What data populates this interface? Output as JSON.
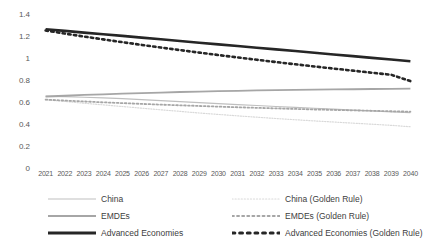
{
  "chart_data": {
    "type": "line",
    "title": "",
    "xlabel": "",
    "ylabel": "",
    "ylim": [
      0,
      1.4
    ],
    "ytick_values": [
      0,
      0.2,
      0.4,
      0.6,
      0.8,
      1,
      1.2,
      1.4
    ],
    "ytick_labels": [
      "0",
      "0.2",
      "0.4",
      "0.6",
      "0.8",
      "1",
      "1.2",
      "1.4"
    ],
    "grid": false,
    "legend_position": "bottom",
    "x": [
      2021,
      2022,
      2023,
      2024,
      2025,
      2026,
      2027,
      2028,
      2029,
      2030,
      2031,
      2032,
      2033,
      2034,
      2035,
      2036,
      2037,
      2038,
      2039,
      2040
    ],
    "xtick_labels": [
      "2021",
      "2022",
      "2023",
      "2024",
      "2025",
      "2026",
      "2027",
      "2028",
      "2029",
      "2030",
      "2031",
      "2032",
      "2033",
      "2034",
      "2035",
      "2036",
      "2037",
      "2038",
      "2039",
      "2040"
    ],
    "series": [
      {
        "name": "China",
        "style": "solid",
        "width": 1.2,
        "color": "#BFBFBF",
        "values": [
          0.651,
          0.648,
          0.643,
          0.637,
          0.63,
          0.622,
          0.613,
          0.604,
          0.595,
          0.586,
          0.577,
          0.568,
          0.559,
          0.551,
          0.543,
          0.535,
          0.527,
          0.519,
          0.511,
          0.503
        ]
      },
      {
        "name": "EMDEs",
        "style": "solid",
        "width": 1.8,
        "color": "#A6A6A6",
        "values": [
          0.65,
          0.657,
          0.664,
          0.67,
          0.676,
          0.681,
          0.686,
          0.691,
          0.695,
          0.699,
          0.702,
          0.705,
          0.708,
          0.71,
          0.712,
          0.714,
          0.716,
          0.718,
          0.719,
          0.721
        ]
      },
      {
        "name": "Advanced Economies",
        "style": "solid",
        "width": 2.6,
        "color": "#262626",
        "values": [
          1.262,
          1.247,
          1.231,
          1.216,
          1.201,
          1.185,
          1.17,
          1.155,
          1.139,
          1.124,
          1.109,
          1.093,
          1.078,
          1.063,
          1.047,
          1.032,
          1.017,
          1.001,
          0.986,
          0.971
        ]
      },
      {
        "name": "China (Golden Rule)",
        "style": "dotted",
        "width": 1.2,
        "color": "#D9D9D9",
        "values": [
          0.62,
          0.605,
          0.589,
          0.574,
          0.559,
          0.544,
          0.529,
          0.515,
          0.5,
          0.487,
          0.474,
          0.462,
          0.45,
          0.439,
          0.428,
          0.418,
          0.408,
          0.398,
          0.388,
          0.375
        ]
      },
      {
        "name": "EMDEs (Golden Rule)",
        "style": "dotted",
        "width": 1.8,
        "color": "#A6A6A6",
        "values": [
          0.622,
          0.613,
          0.605,
          0.597,
          0.59,
          0.583,
          0.576,
          0.57,
          0.564,
          0.558,
          0.552,
          0.547,
          0.542,
          0.537,
          0.532,
          0.528,
          0.524,
          0.52,
          0.516,
          0.512
        ]
      },
      {
        "name": "Advanced Economies (Golden Rule)",
        "style": "dotted",
        "width": 2.6,
        "color": "#262626",
        "values": [
          1.25,
          1.222,
          1.195,
          1.169,
          1.144,
          1.119,
          1.095,
          1.072,
          1.049,
          1.027,
          1.005,
          0.984,
          0.963,
          0.943,
          0.923,
          0.904,
          0.885,
          0.866,
          0.848,
          0.79
        ]
      }
    ]
  },
  "legend": {
    "left_items": [
      {
        "label": "China",
        "color": "#BFBFBF",
        "style": "solid",
        "width": 1.2
      },
      {
        "label": "EMDEs",
        "color": "#A6A6A6",
        "style": "solid",
        "width": 2.0
      },
      {
        "label": "Advanced Economies",
        "color": "#262626",
        "style": "solid",
        "width": 3.0
      }
    ],
    "right_items": [
      {
        "label": "China (Golden Rule)",
        "color": "#D9D9D9",
        "style": "dotted",
        "width": 1.2
      },
      {
        "label": "EMDEs (Golden Rule)",
        "color": "#A6A6A6",
        "style": "dotted",
        "width": 2.0
      },
      {
        "label": "Advanced Economies (Golden Rule)",
        "color": "#262626",
        "style": "dotted",
        "width": 3.0
      }
    ]
  },
  "colors": {
    "axis_text": "#595959",
    "legend_text": "#404040",
    "background": "#FFFFFF"
  }
}
